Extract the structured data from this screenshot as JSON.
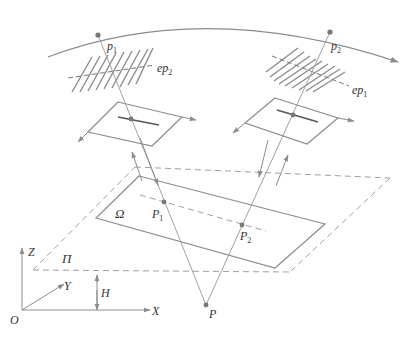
{
  "diagram": {
    "type": "stereo-vision-epipolar-geometry",
    "colors": {
      "line": "#8c8c8c",
      "dark_line": "#555555",
      "point": "#777777",
      "text": "#333333",
      "background": "#ffffff"
    },
    "labels": {
      "p1": {
        "main": "p",
        "sub": "1"
      },
      "p2": {
        "main": "p",
        "sub": "2"
      },
      "ep1": {
        "main": "ep",
        "sub": "1"
      },
      "ep2": {
        "main": "ep",
        "sub": "2"
      },
      "P1": {
        "main": "P",
        "sub": "1"
      },
      "P2": {
        "main": "P",
        "sub": "2"
      },
      "P": "P",
      "omega": "Ω",
      "pi": "Π",
      "H": "H",
      "O": "O",
      "X": "X",
      "Y": "Y",
      "Z": "Z"
    },
    "elements": [
      {
        "id": "trajectory-arc",
        "desc": "camera trajectory arc with arrow"
      },
      {
        "id": "left-image-plane",
        "desc": "camera image plane at p1"
      },
      {
        "id": "right-image-plane",
        "desc": "camera image plane at p2"
      },
      {
        "id": "left-hatch",
        "desc": "epipolar line bundle ep2"
      },
      {
        "id": "right-hatch",
        "desc": "epipolar line bundle ep1"
      },
      {
        "id": "ground-plane-pi",
        "desc": "dashed reference plane Π"
      },
      {
        "id": "region-omega",
        "desc": "target region Ω"
      },
      {
        "id": "world-axes",
        "desc": "coordinate frame O-XYZ"
      }
    ]
  }
}
